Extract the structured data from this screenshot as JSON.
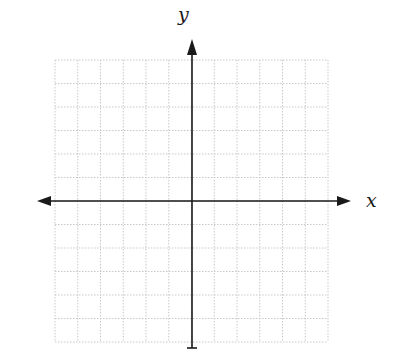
{
  "diagram": {
    "type": "coordinate-plane",
    "x_axis_label": "x",
    "y_axis_label": "y",
    "grid": {
      "columns": 12,
      "rows": 12,
      "x_range": [
        -6,
        6
      ],
      "y_range": [
        -6,
        6
      ],
      "line_style": "dotted",
      "line_color": "#c8c8c8"
    },
    "axis_color": "#1a1a1a",
    "arrows": {
      "x_axis": "both-ends",
      "y_axis": "top"
    }
  }
}
